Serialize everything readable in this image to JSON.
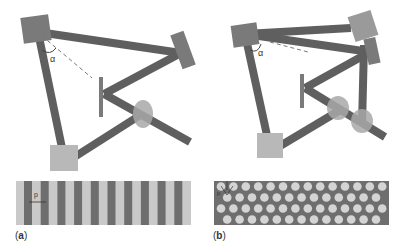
{
  "figure": {
    "colors": {
      "beam": "#5f5f5f",
      "mirror": "#7a7a7a",
      "mirror_light": "#9a9a9a",
      "square": "#b8b8b8",
      "lens": "#a8a8a8",
      "grating_bg": "#c9c9c9",
      "grating_bar": "#6e6e6e",
      "hex_bg": "#6e6e6e",
      "hex_dot": "#d4d4d4",
      "dash": "#777777"
    },
    "panels": [
      {
        "id": "a",
        "label_open": "(",
        "label_letter": "a",
        "label_close": ")",
        "angle_symbol": "α",
        "period_symbol": "p",
        "pattern": "1D grating",
        "bar_count": 10
      },
      {
        "id": "b",
        "label_open": "(",
        "label_letter": "b",
        "label_close": ")",
        "angle_symbol": "α",
        "period_symbol": "p",
        "pattern": "hexagonal lattice",
        "rows": [
          14,
          13,
          14,
          13
        ]
      }
    ]
  }
}
